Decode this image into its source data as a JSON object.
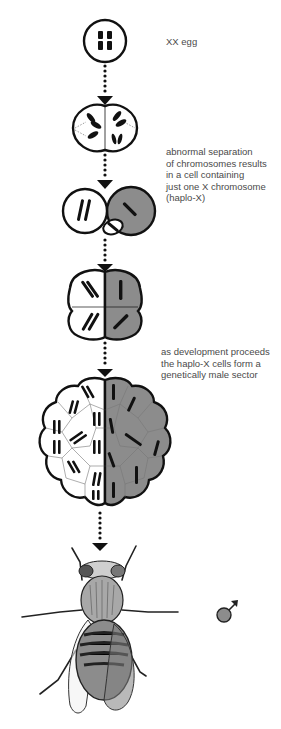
{
  "diagram": {
    "stages": [
      {
        "id": "egg",
        "label": "XX egg"
      },
      {
        "id": "two-cell",
        "label": ""
      },
      {
        "id": "haplo-x-division",
        "label": "abnormal separation\nof chromosomes results\nin a cell containing\njust one X chromosome\n(haplo-X)"
      },
      {
        "id": "four-cell",
        "label": ""
      },
      {
        "id": "multicell",
        "label": "as development proceeds\nthe haplo-X cells form a\ngenetically male sector"
      },
      {
        "id": "adult-fly",
        "label": ""
      }
    ],
    "symbol": {
      "name": "male-symbol",
      "glyph": "♂"
    },
    "colors": {
      "line": "#111111",
      "male_sector_fill": "#8c8c8c",
      "female_fill": "#ffffff",
      "text": "#4a4a4a"
    }
  }
}
